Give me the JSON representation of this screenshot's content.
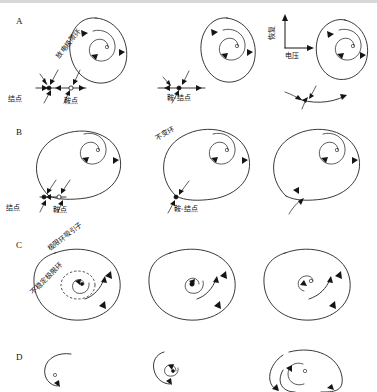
{
  "figure": {
    "title_text": "",
    "panels": [
      {
        "letter": "A",
        "labels": {
          "limit_cycle": "放电极限环",
          "node": "结点",
          "saddle": "鞍点",
          "saddle_node": "鞍-结点",
          "axis_y": "恢复",
          "axis_x": "电压"
        }
      },
      {
        "letter": "B",
        "labels": {
          "invariant_circle": "不变环",
          "node": "结点",
          "saddle": "鞍点",
          "saddle_node": "鞍-结点"
        }
      },
      {
        "letter": "C",
        "labels": {
          "limit_cycle_attractor": "极限环吸引子",
          "unstable_limit_cycle": "不稳定极限环"
        }
      },
      {
        "letter": "D",
        "labels": {}
      }
    ]
  },
  "colors": {
    "stroke": "#151515",
    "background": "#ffffff",
    "rule": "#d8d8d8"
  }
}
